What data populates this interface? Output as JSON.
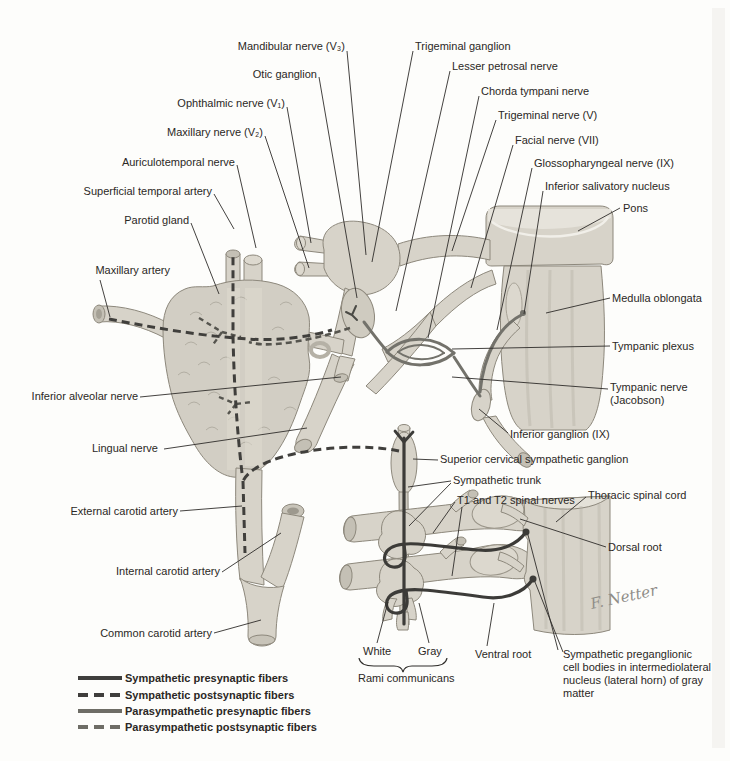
{
  "figure": {
    "background": "#fdfdfb",
    "signature": "F. Netter"
  },
  "labels": {
    "mandibular_nerve_v3": "Mandibular nerve (V₃)",
    "otic_ganglion": "Otic ganglion",
    "ophthalmic_nerve_v1": "Ophthalmic nerve (V₁)",
    "maxillary_nerve_v2": "Maxillary nerve (V₂)",
    "auriculotemporal_nerve": "Auriculotemporal nerve",
    "superficial_temporal_artery": "Superficial temporal artery",
    "parotid_gland": "Parotid gland",
    "maxillary_artery": "Maxillary artery",
    "inferior_alveolar_nerve": "Inferior alveolar nerve",
    "lingual_nerve": "Lingual nerve",
    "external_carotid_artery": "External carotid artery",
    "internal_carotid_artery": "Internal carotid artery",
    "common_carotid_artery": "Common carotid artery",
    "trigeminal_ganglion": "Trigeminal ganglion",
    "lesser_petrosal_nerve": "Lesser petrosal nerve",
    "chorda_tympani_nerve": "Chorda tympani nerve",
    "trigeminal_nerve_v": "Trigeminal nerve (V)",
    "facial_nerve_vii": "Facial nerve (VII)",
    "glossopharyngeal_nerve_ix": "Glossopharyngeal nerve (IX)",
    "inferior_salivatory_nucleus": "Inferior salivatory nucleus",
    "pons": "Pons",
    "medulla_oblongata": "Medulla oblongata",
    "tympanic_plexus": "Tympanic plexus",
    "tympanic_nerve_jacobson": "Tympanic nerve\n(Jacobson)",
    "inferior_ganglion_ix": "Inferior ganglion (IX)",
    "superior_cervical_sympathetic_ganglion": "Superior cervical sympathetic ganglion",
    "sympathetic_trunk": "Sympathetic trunk",
    "t1_t2_spinal_nerves": "T1 and T2 spinal nerves",
    "thoracic_spinal_cord": "Thoracic spinal cord",
    "dorsal_root": "Dorsal root",
    "white": "White",
    "gray": "Gray",
    "rami_communicans": "Rami communicans",
    "ventral_root": "Ventral root",
    "sympathetic_preganglionic": "Sympathetic preganglionic\ncell bodies in intermediolateral\nnucleus (lateral horn) of gray\nmatter"
  },
  "legend": {
    "items": [
      {
        "label": "Sympathetic presynaptic fibers",
        "line": "solid",
        "color": "#3f3e3c"
      },
      {
        "label": "Sympathetic postsynaptic fibers",
        "line": "dashed",
        "color": "#3f3e3c"
      },
      {
        "label": "Parasympathetic presynaptic fibers",
        "line": "solid",
        "color": "#6e6d66"
      },
      {
        "label": "Parasympathetic postsynaptic fibers",
        "line": "dashed",
        "color": "#6e6d66"
      }
    ]
  },
  "colors": {
    "structure_fill": "#d7d3c9",
    "structure_stroke": "#8d887c",
    "label_text": "#2b2825",
    "sympathetic_fiber": "#3f3e3c",
    "parasympathetic_fiber": "#6e6d66"
  }
}
